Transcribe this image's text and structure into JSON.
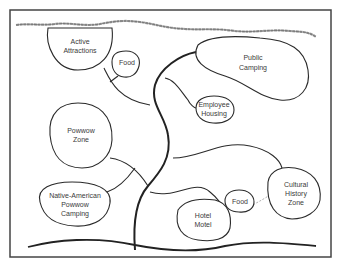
{
  "diagram": {
    "type": "bubble-diagram",
    "zones": [
      {
        "id": "active-attractions",
        "label_lines": [
          "Active",
          "Attractions"
        ]
      },
      {
        "id": "food-north",
        "label_lines": [
          "Food"
        ]
      },
      {
        "id": "public-camping",
        "label_lines": [
          "Public",
          "Camping"
        ]
      },
      {
        "id": "employee-housing",
        "label_lines": [
          "Employee",
          "Housing"
        ]
      },
      {
        "id": "powwow-zone",
        "label_lines": [
          "Powwow",
          "Zone"
        ]
      },
      {
        "id": "native-american-powwow-camping",
        "label_lines": [
          "Native-American",
          "Powwow",
          "Camping"
        ]
      },
      {
        "id": "food-south",
        "label_lines": [
          "Food"
        ]
      },
      {
        "id": "hotel-motel",
        "label_lines": [
          "Hotel",
          "Motel"
        ]
      },
      {
        "id": "cultural-history-zone",
        "label_lines": [
          "Cultural",
          "History",
          "Zone"
        ]
      }
    ],
    "features": {
      "river": "wavy line along top edge",
      "ground": "wavy line along bottom edge",
      "main_road": "thick curving spine from bottom to top",
      "dashed_link": "Food (south) to Cultural History Zone"
    }
  },
  "labels": {
    "active": "Active",
    "attractions": "Attractions",
    "food1": "Food",
    "public": "Public",
    "camping": "Camping",
    "employee": "Employee",
    "housing": "Housing",
    "powwow": "Powwow",
    "zone": "Zone",
    "native": "Native-American",
    "powwow2": "Powwow",
    "camping2": "Camping",
    "food2": "Food",
    "hotel": "Hotel",
    "motel": "Motel",
    "cultural": "Cultural",
    "history": "History",
    "zone2": "Zone"
  }
}
